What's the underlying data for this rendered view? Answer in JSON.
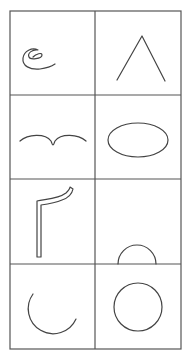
{
  "grid": {
    "columns": 2,
    "rows": 4,
    "x_lines": [
      10,
      95,
      181
    ],
    "y_lines": [
      11,
      95,
      179,
      264,
      349
    ],
    "line_color": "#555555"
  },
  "cells": [
    {
      "row": 0,
      "col": 0,
      "shape": "spiral-curve"
    },
    {
      "row": 0,
      "col": 1,
      "shape": "caret-angle"
    },
    {
      "row": 1,
      "col": 0,
      "shape": "bird-wave"
    },
    {
      "row": 1,
      "col": 1,
      "shape": "ellipse"
    },
    {
      "row": 2,
      "col": 0,
      "shape": "hollow-hook-bar"
    },
    {
      "row": 2,
      "col": 1,
      "shape": "semicircle"
    },
    {
      "row": 3,
      "col": 0,
      "shape": "open-arc"
    },
    {
      "row": 3,
      "col": 1,
      "shape": "circle"
    }
  ],
  "stroke_color": "#444444"
}
